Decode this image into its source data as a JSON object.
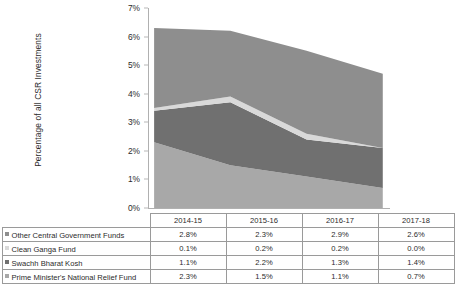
{
  "chart_data": {
    "type": "area",
    "title": "",
    "xlabel": "",
    "ylabel": "Percentage of all CSR Investments",
    "categories": [
      "2014-15",
      "2015-16",
      "2016-17",
      "2017-18"
    ],
    "ylim": [
      0,
      7
    ],
    "ytick_labels": [
      "0%",
      "1%",
      "2%",
      "3%",
      "4%",
      "5%",
      "6%",
      "7%"
    ],
    "ytick_values": [
      0,
      1,
      2,
      3,
      4,
      5,
      6,
      7
    ],
    "grid": false,
    "stacked": true,
    "stack_order_bottom_to_top": [
      "Prime Minister's National Relief Fund",
      "Swachh Bharat Kosh",
      "Clean Ganga Fund",
      "Other Central Government Funds"
    ],
    "legend_position": "table-below",
    "series": [
      {
        "name": "Other Central Government Funds",
        "color": "#8e8e8e",
        "values": [
          2.8,
          2.3,
          2.9,
          2.6
        ],
        "value_labels": [
          "2.8%",
          "2.3%",
          "2.9%",
          "2.6%"
        ]
      },
      {
        "name": "Clean Ganga Fund",
        "color": "#d9d9d9",
        "values": [
          0.1,
          0.2,
          0.2,
          0.0
        ],
        "value_labels": [
          "0.1%",
          "0.2%",
          "0.2%",
          "0.0%"
        ]
      },
      {
        "name": "Swachh Bharat Kosh",
        "color": "#707070",
        "values": [
          1.1,
          2.2,
          1.3,
          1.4
        ],
        "value_labels": [
          "1.1%",
          "2.2%",
          "1.3%",
          "1.4%"
        ]
      },
      {
        "name": "Prime Minister's National Relief Fund",
        "color": "#a8a8a8",
        "values": [
          2.3,
          1.5,
          1.1,
          0.7
        ],
        "value_labels": [
          "2.3%",
          "1.5%",
          "1.1%",
          "0.7%"
        ]
      }
    ],
    "totals": [
      6.3,
      6.2,
      5.5,
      4.7
    ]
  },
  "table": {
    "header_blank_label": "",
    "columns": [
      "2014-15",
      "2015-16",
      "2016-17",
      "2017-18"
    ],
    "rows": [
      {
        "label": "Other Central Government Funds",
        "swatch_color": "#8e8e8e",
        "values": [
          "2.8%",
          "2.3%",
          "2.9%",
          "2.6%"
        ]
      },
      {
        "label": "Clean Ganga Fund",
        "swatch_color": "#d9d9d9",
        "values": [
          "0.1%",
          "0.2%",
          "0.2%",
          "0.0%"
        ]
      },
      {
        "label": "Swachh Bharat Kosh",
        "swatch_color": "#707070",
        "values": [
          "1.1%",
          "2.2%",
          "1.3%",
          "1.4%"
        ]
      },
      {
        "label": "Prime Minister's National Relief Fund",
        "swatch_color": "#a8a8a8",
        "values": [
          "2.3%",
          "1.5%",
          "1.1%",
          "0.7%"
        ]
      }
    ]
  },
  "axis": {
    "y_title": "Percentage of all CSR Investments",
    "axis_color": "#b0b0b0"
  }
}
